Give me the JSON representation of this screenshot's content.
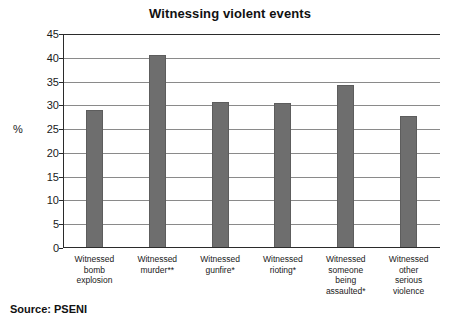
{
  "chart_data": {
    "type": "bar",
    "title": "Witnessing violent events",
    "xlabel": "",
    "ylabel": "%",
    "ylim": [
      0,
      45
    ],
    "ytick_step": 5,
    "yticks": [
      45,
      40,
      35,
      30,
      25,
      20,
      15,
      10,
      5,
      0
    ],
    "grid": true,
    "legend": "none",
    "bar_color": "#6e6e6e",
    "categories": [
      "Witnessed bomb explosion",
      "Witnessed murder**",
      "Witnessed gunfire*",
      "Witnessed rioting*",
      "Witnessed someone being assaulted*",
      "Witnessed other serious violence"
    ],
    "category_lines": [
      [
        "Witnessed",
        "bomb",
        "explosion"
      ],
      [
        "Witnessed",
        "murder**"
      ],
      [
        "Witnessed",
        "gunfire*"
      ],
      [
        "Witnessed",
        "rioting*"
      ],
      [
        "Witnessed",
        "someone",
        "being",
        "assaulted*"
      ],
      [
        "Witnessed",
        "other",
        "serious",
        "violence"
      ]
    ],
    "values": [
      29.0,
      40.5,
      30.7,
      30.5,
      34.3,
      27.8
    ]
  },
  "source": {
    "label": "Source: PSENI"
  }
}
